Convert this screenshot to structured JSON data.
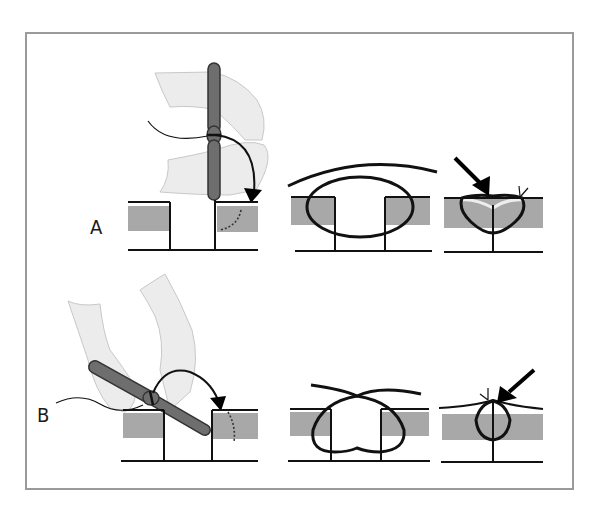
{
  "figure": {
    "panels": [
      {
        "id": "A",
        "label": "A",
        "description": "Needle holder vertical, needle rotated over wound edge; suture loop encircles both edges; knot tied with everted edges (arrow)"
      },
      {
        "id": "B",
        "label": "B",
        "description": "Needle holder angled, needle passed with wrist rotation; suture forms flask-shaped loop; knot closes with wound edge apposition (arrow)"
      }
    ],
    "colors": {
      "frame": "#9a9a9a",
      "tissue": "#a8a8a8",
      "needle_holder": "#6e6e6e",
      "glove": "#ececec",
      "line": "#111111"
    }
  }
}
